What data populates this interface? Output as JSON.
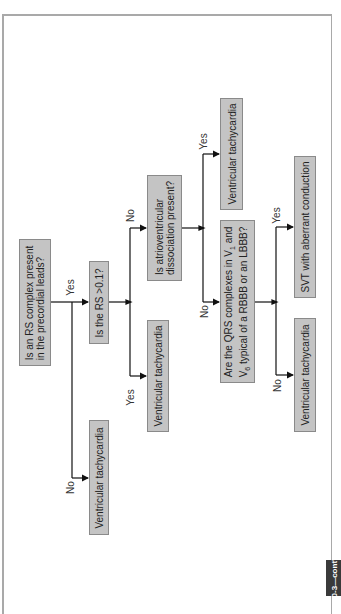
{
  "figure_tab": "10-3—cont'd",
  "nodes": {
    "q1": {
      "text_line1": "Is an RS complex present",
      "text_line2": "in the precordial leads?"
    },
    "q2": {
      "text_line1": "Is the RS >0.1?"
    },
    "q3": {
      "text_line1": "Is atrioventricular",
      "text_line2": "dissociation present?"
    },
    "q4": {
      "text_line1a": "Are the QRS complexes in V",
      "text_line1_sub": "1",
      "text_line1b": " and",
      "text_line2a": "V",
      "text_line2_sub": "6",
      "text_line2b": " typical of a RBBB or an LBBB?"
    },
    "vt_q1_no": {
      "text": "Ventricular tachycardia"
    },
    "vt_q2_yes": {
      "text": "Ventricular tachycardia"
    },
    "vt_q3_yes": {
      "text": "Ventricular tachycardia"
    },
    "vt_q4_no": {
      "text": "Ventricular tachycardia"
    },
    "svt_q4_yes": {
      "text": "SVT with aberrant conduction"
    }
  },
  "edge_labels": {
    "q1_yes": "Yes",
    "q1_no": "No",
    "q2_yes": "Yes",
    "q2_no": "No",
    "q3_yes": "Yes",
    "q3_no": "No",
    "q4_yes": "Yes",
    "q4_no": "No"
  },
  "colors": {
    "box_fill": "#c4c4c4",
    "box_border": "#8a8a8a",
    "line": "#111111",
    "frame": "#a9a9a9",
    "tab": "#3a3a3a"
  }
}
